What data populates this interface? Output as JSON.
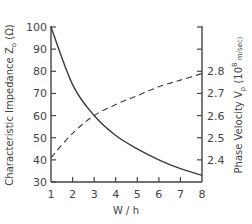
{
  "chart_data": {
    "type": "line",
    "title": "",
    "xlabel": "W / h",
    "ylabel": "Characteristic Impedance Z0 (Ω)",
    "ylabel_right": "Phase Velocity Vp (10^8 m/sec)",
    "x": [
      1,
      2,
      3,
      4,
      5,
      6,
      7,
      8
    ],
    "xlim": [
      1,
      8
    ],
    "ylim": [
      30,
      100
    ],
    "ylim_right": [
      2.3,
      3.0
    ],
    "x_ticks": [
      "1",
      "2",
      "3",
      "4",
      "5",
      "6",
      "7",
      "8"
    ],
    "y_ticks": [
      "100",
      "90",
      "80",
      "70",
      "60",
      "50",
      "40",
      "30"
    ],
    "y_ticks_right": [
      "",
      "",
      "2.8",
      "2.7",
      "2.6",
      "2.5",
      "2.4",
      ""
    ],
    "grid": false,
    "legend": "none",
    "series": [
      {
        "name": "Characteristic Impedance Z0",
        "axis": "left",
        "style": "solid",
        "values": [
          100,
          74,
          60,
          51,
          45,
          40,
          36,
          33
        ]
      },
      {
        "name": "Phase Velocity Vp",
        "axis": "right",
        "style": "dashed",
        "values": [
          2.41,
          2.52,
          2.6,
          2.65,
          2.69,
          2.73,
          2.76,
          2.79
        ]
      }
    ]
  },
  "labels": {
    "xlabel": "W / h",
    "ylabel_left_main": "Characteristic Impedance Z",
    "ylabel_left_sub": "o",
    "ylabel_left_unit": " (Ω)",
    "ylabel_right_main": "Phase Velocity V",
    "ylabel_right_sub": "p",
    "ylabel_right_unit": " (10",
    "ylabel_right_exp": "8",
    "ylabel_right_unit2": " m/sec)"
  }
}
